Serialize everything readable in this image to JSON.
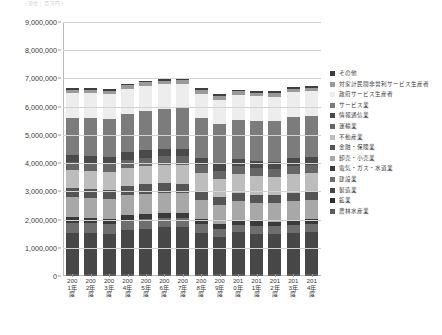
{
  "top_note": "（単位：百万円）",
  "legend": {
    "items": [
      {
        "label": "その他",
        "color": "#3f3f3f"
      },
      {
        "label": "対家計民間非営利サービス生産者",
        "color": "#9a9a9a"
      },
      {
        "label": "政府サービス生産者",
        "color": "#ededed"
      },
      {
        "label": "サービス業",
        "color": "#7c7c7c"
      },
      {
        "label": "情報通信業",
        "color": "#4a4a4a"
      },
      {
        "label": "運輸業",
        "color": "#666666"
      },
      {
        "label": "不動産業",
        "color": "#bdbdbd"
      },
      {
        "label": "金融・保険業",
        "color": "#555555"
      },
      {
        "label": "卸売・小売業",
        "color": "#a8a8a8"
      },
      {
        "label": "電気・ガス・水道業",
        "color": "#3a3a3a"
      },
      {
        "label": "建設業",
        "color": "#6e6e6e"
      },
      {
        "label": "製造業",
        "color": "#474747"
      },
      {
        "label": "鉱業",
        "color": "#2f2f2f"
      },
      {
        "label": "農林水産業",
        "color": "#5d5d5d"
      }
    ]
  },
  "chart_data": {
    "type": "bar",
    "stacked": true,
    "title": "",
    "xlabel": "",
    "ylabel": "",
    "ylim": [
      0,
      9000000
    ],
    "ytick_step": 1000000,
    "ytick_labels": [
      "0",
      "1,000,000",
      "2,000,000",
      "3,000,000",
      "4,000,000",
      "5,000,000",
      "6,000,000",
      "7,000,000",
      "8,000,000",
      "9,000,000"
    ],
    "grid": true,
    "legend_position": "right",
    "categories": [
      "2001年度",
      "2002年度",
      "2003年度",
      "2004年度",
      "2005年度",
      "2006年度",
      "2007年度",
      "2008年度",
      "2009年度",
      "2010年度",
      "2011年度",
      "2012年度",
      "2013年度",
      "2014年度"
    ],
    "series": [
      {
        "name": "農林水産業",
        "color": "#5d5d5d",
        "values": [
          70000,
          68000,
          66000,
          65000,
          64000,
          63000,
          62000,
          60000,
          58000,
          57000,
          56000,
          56000,
          57000,
          58000
        ]
      },
      {
        "name": "鉱業",
        "color": "#2f2f2f",
        "values": [
          12000,
          11000,
          11000,
          11000,
          10000,
          10000,
          10000,
          9000,
          8000,
          8000,
          8000,
          8000,
          8000,
          8000
        ]
      },
      {
        "name": "製造業",
        "color": "#474747",
        "values": [
          1430000,
          1430000,
          1420000,
          1560000,
          1600000,
          1650000,
          1680000,
          1470000,
          1330000,
          1480000,
          1440000,
          1420000,
          1450000,
          1480000
        ]
      },
      {
        "name": "建設業",
        "color": "#6e6e6e",
        "values": [
          380000,
          360000,
          340000,
          330000,
          330000,
          320000,
          300000,
          290000,
          280000,
          270000,
          280000,
          290000,
          310000,
          310000
        ]
      },
      {
        "name": "電気・ガス・水道業",
        "color": "#3a3a3a",
        "values": [
          190000,
          190000,
          190000,
          190000,
          190000,
          190000,
          190000,
          180000,
          180000,
          180000,
          150000,
          140000,
          150000,
          160000
        ]
      },
      {
        "name": "卸売・小売業",
        "color": "#a8a8a8",
        "values": [
          720000,
          710000,
          700000,
          700000,
          710000,
          710000,
          700000,
          670000,
          650000,
          660000,
          660000,
          660000,
          680000,
          670000
        ]
      },
      {
        "name": "金融・保険業",
        "color": "#555555",
        "values": [
          330000,
          320000,
          320000,
          330000,
          340000,
          340000,
          330000,
          300000,
          290000,
          290000,
          290000,
          290000,
          300000,
          300000
        ]
      },
      {
        "name": "不動産業",
        "color": "#bdbdbd",
        "values": [
          610000,
          620000,
          630000,
          640000,
          650000,
          660000,
          670000,
          660000,
          660000,
          660000,
          660000,
          660000,
          670000,
          670000
        ]
      },
      {
        "name": "運輸業",
        "color": "#666666",
        "values": [
          290000,
          290000,
          290000,
          300000,
          300000,
          300000,
          300000,
          280000,
          270000,
          280000,
          280000,
          280000,
          290000,
          290000
        ]
      },
      {
        "name": "情報通信業",
        "color": "#4a4a4a",
        "values": [
          250000,
          250000,
          260000,
          260000,
          270000,
          270000,
          270000,
          260000,
          250000,
          250000,
          250000,
          250000,
          260000,
          260000
        ]
      },
      {
        "name": "サービス業",
        "color": "#7c7c7c",
        "values": [
          1320000,
          1340000,
          1350000,
          1370000,
          1400000,
          1420000,
          1440000,
          1420000,
          1400000,
          1410000,
          1420000,
          1430000,
          1460000,
          1470000
        ]
      },
      {
        "name": "政府サービス生産者",
        "color": "#ededed",
        "values": [
          880000,
          890000,
          880000,
          880000,
          880000,
          870000,
          870000,
          870000,
          880000,
          880000,
          880000,
          880000,
          880000,
          880000
        ]
      },
      {
        "name": "対家計民間非営利サービス生産者",
        "color": "#9a9a9a",
        "values": [
          120000,
          120000,
          120000,
          120000,
          120000,
          120000,
          120000,
          120000,
          120000,
          120000,
          120000,
          120000,
          120000,
          120000
        ]
      },
      {
        "name": "その他",
        "color": "#3f3f3f",
        "values": [
          60000,
          60000,
          60000,
          60000,
          60000,
          60000,
          60000,
          60000,
          60000,
          60000,
          60000,
          60000,
          60000,
          60000
        ]
      }
    ]
  }
}
